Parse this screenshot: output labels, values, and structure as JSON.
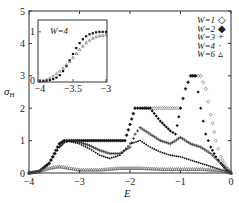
{
  "chart_data": {
    "type": "scatter",
    "title": "",
    "xlabel": "E",
    "ylabel": "σH",
    "xlim": [
      -4,
      0
    ],
    "ylim": [
      0,
      5
    ],
    "xticks": [
      "-4",
      "-3",
      "-2",
      "-1",
      "0"
    ],
    "yticks": [
      "0",
      "1",
      "2",
      "3",
      "4",
      "5"
    ],
    "grid": false,
    "legend_position": "upper right",
    "legend": [
      {
        "label": "W=1",
        "marker": "◇"
      },
      {
        "label": "W=2",
        "marker": "◆"
      },
      {
        "label": "W=3",
        "marker": "+"
      },
      {
        "label": "W=4",
        "marker": "·"
      },
      {
        "label": "W=6",
        "marker": "▵"
      }
    ],
    "series": [
      {
        "name": "W=1",
        "marker": "diamond-open",
        "x": [
          -4.0,
          -3.8,
          -3.6,
          -3.5,
          -3.4,
          -3.3,
          -3.2,
          -3.0,
          -2.5,
          -2.1,
          -2.0,
          -1.9,
          -1.8,
          -1.6,
          -1.4,
          -1.2,
          -1.0,
          -0.9,
          -0.8,
          -0.7,
          -0.6,
          -0.5,
          -0.4,
          -0.3,
          -0.2,
          -0.1,
          0.0
        ],
        "y": [
          0.0,
          0.05,
          0.3,
          0.6,
          0.9,
          1.0,
          1.0,
          1.0,
          1.0,
          1.0,
          1.5,
          2.0,
          2.0,
          2.0,
          2.0,
          2.0,
          2.0,
          2.6,
          3.0,
          3.0,
          3.0,
          2.6,
          1.8,
          1.0,
          0.5,
          0.2,
          0.0
        ]
      },
      {
        "name": "W=2",
        "marker": "diamond-filled",
        "x": [
          -4.0,
          -3.8,
          -3.6,
          -3.5,
          -3.4,
          -3.3,
          -3.2,
          -3.0,
          -2.5,
          -2.1,
          -2.0,
          -1.9,
          -1.8,
          -1.6,
          -1.4,
          -1.2,
          -1.1,
          -1.0,
          -0.9,
          -0.8,
          -0.7,
          -0.6,
          -0.5,
          -0.4,
          -0.3,
          -0.2,
          -0.1,
          0.0
        ],
        "y": [
          0.0,
          0.05,
          0.3,
          0.6,
          0.9,
          1.0,
          1.0,
          1.0,
          1.0,
          1.0,
          1.5,
          2.0,
          2.0,
          2.0,
          1.6,
          1.3,
          1.2,
          2.0,
          2.6,
          3.0,
          3.0,
          2.0,
          1.2,
          0.8,
          0.5,
          0.3,
          0.1,
          0.0
        ]
      },
      {
        "name": "W=3",
        "marker": "plus",
        "x": [
          -4.0,
          -3.8,
          -3.6,
          -3.4,
          -3.3,
          -3.2,
          -3.0,
          -2.8,
          -2.6,
          -2.4,
          -2.2,
          -2.0,
          -1.9,
          -1.8,
          -1.6,
          -1.4,
          -1.2,
          -1.0,
          -0.8,
          -0.6,
          -0.4,
          -0.2,
          0.0
        ],
        "y": [
          0.0,
          0.05,
          0.3,
          0.8,
          0.95,
          1.0,
          0.95,
          0.85,
          0.7,
          0.6,
          0.6,
          0.8,
          1.2,
          1.4,
          1.2,
          1.0,
          0.9,
          1.1,
          0.9,
          0.8,
          0.6,
          0.3,
          0.0
        ]
      },
      {
        "name": "W=4",
        "marker": "dot",
        "x": [
          -4.0,
          -3.8,
          -3.6,
          -3.4,
          -3.3,
          -3.2,
          -3.0,
          -2.8,
          -2.6,
          -2.4,
          -2.2,
          -2.0,
          -1.8,
          -1.6,
          -1.4,
          -1.2,
          -1.0,
          -0.8,
          -0.6,
          -0.4,
          -0.2,
          0.0
        ],
        "y": [
          0.0,
          0.05,
          0.3,
          0.8,
          0.95,
          0.98,
          0.9,
          0.75,
          0.55,
          0.45,
          0.55,
          0.9,
          1.0,
          0.8,
          0.65,
          0.55,
          0.5,
          0.4,
          0.3,
          0.2,
          0.1,
          0.0
        ]
      },
      {
        "name": "W=6",
        "marker": "triangle-open",
        "x": [
          -4.0,
          -3.8,
          -3.6,
          -3.4,
          -3.2,
          -3.0,
          -2.6,
          -2.2,
          -1.8,
          -1.4,
          -1.0,
          -0.6,
          -0.4,
          -0.2,
          0.0
        ],
        "y": [
          0.0,
          0.05,
          0.15,
          0.2,
          0.15,
          0.1,
          0.1,
          0.15,
          0.15,
          0.12,
          0.12,
          0.12,
          0.1,
          0.08,
          0.0
        ]
      }
    ],
    "inset": {
      "label": "W=4",
      "xlim": [
        -4,
        -3
      ],
      "ylim": [
        0,
        1.2
      ],
      "xticks": [
        "-4",
        "-3.5",
        "-3"
      ],
      "yticks": [
        "0",
        "1"
      ],
      "series": [
        {
          "name": "filled",
          "marker": "square-filled",
          "x": [
            -4.0,
            -3.95,
            -3.9,
            -3.85,
            -3.8,
            -3.75,
            -3.7,
            -3.65,
            -3.6,
            -3.55,
            -3.5,
            -3.45,
            -3.4,
            -3.35,
            -3.3,
            -3.25,
            -3.2,
            -3.15,
            -3.1,
            -3.05,
            -3.0
          ],
          "y": [
            0.0,
            0.0,
            0.01,
            0.02,
            0.04,
            0.07,
            0.12,
            0.2,
            0.3,
            0.42,
            0.55,
            0.67,
            0.77,
            0.85,
            0.91,
            0.95,
            0.97,
            0.99,
            1.0,
            1.0,
            1.0
          ]
        },
        {
          "name": "open",
          "marker": "triangle-open",
          "x": [
            -4.0,
            -3.95,
            -3.9,
            -3.85,
            -3.8,
            -3.75,
            -3.7,
            -3.65,
            -3.6,
            -3.55,
            -3.5,
            -3.45,
            -3.4,
            -3.35,
            -3.3,
            -3.25,
            -3.2,
            -3.15,
            -3.1,
            -3.05,
            -3.0
          ],
          "y": [
            0.0,
            0.01,
            0.03,
            0.06,
            0.1,
            0.15,
            0.2,
            0.26,
            0.33,
            0.4,
            0.48,
            0.56,
            0.64,
            0.71,
            0.78,
            0.83,
            0.87,
            0.9,
            0.92,
            0.93,
            0.94
          ]
        }
      ]
    }
  }
}
